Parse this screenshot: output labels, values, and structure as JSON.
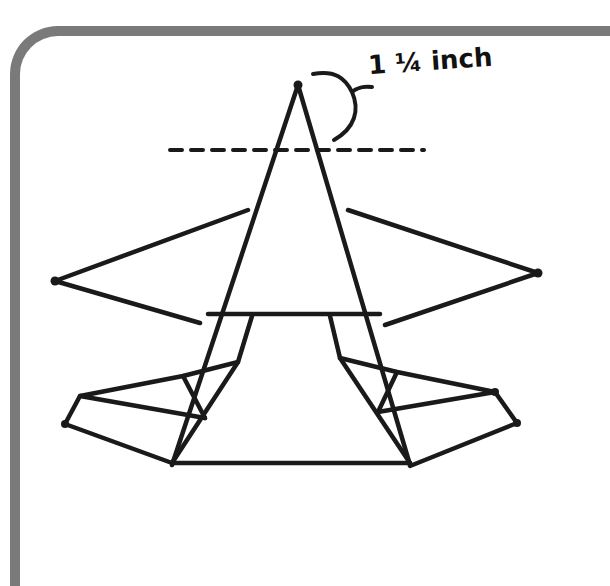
{
  "figure": {
    "annotation": "1 ¼ inch",
    "annotation_parts": {
      "whole": "1",
      "fraction": "¼",
      "unit": "inch"
    },
    "colors": {
      "stroke": "#1a1a1a",
      "frame": "#7a7a7a",
      "background": "#ffffff"
    }
  }
}
